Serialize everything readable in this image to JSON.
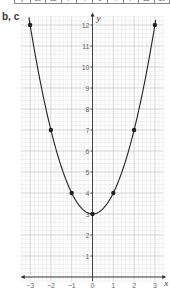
{
  "table": {
    "header": "y",
    "values": [
      "19",
      "12",
      "7",
      "4",
      "3",
      "4",
      "7",
      "12",
      "19"
    ]
  },
  "part_label": "b, c",
  "chart_data": {
    "type": "line",
    "title": "",
    "function": "y = x^2 + 3",
    "xlabel": "x",
    "ylabel": "y",
    "x": [
      -3,
      -2,
      -1,
      0,
      1,
      2,
      3
    ],
    "series": [
      {
        "name": "y = x² + 3",
        "values": [
          12,
          7,
          4,
          3,
          4,
          7,
          12
        ]
      }
    ],
    "xlim": [
      -3.4,
      3.4
    ],
    "ylim": [
      -0.2,
      12.4
    ],
    "x_ticks": [
      "-3",
      "-2",
      "-1",
      "0",
      "1",
      "2",
      "3"
    ],
    "y_ticks": [
      "1",
      "2",
      "3",
      "4",
      "5",
      "6",
      "7",
      "8",
      "9",
      "10",
      "11",
      "12"
    ],
    "grid": true,
    "minor_grid_step": 0.2,
    "legend": "none"
  },
  "colors": {
    "curve": "#222222",
    "grid_major": "#b8b8b8",
    "grid_minor": "#dcdcdc",
    "axis": "#333333",
    "tick_label": "#666666"
  }
}
